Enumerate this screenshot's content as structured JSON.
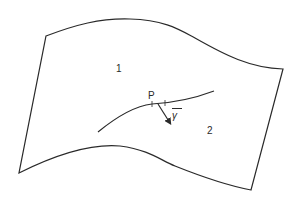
{
  "figure": {
    "surface": {
      "description": "curved surface patch",
      "stroke_color": "#2a2a2a"
    },
    "labels": {
      "region_1": "1",
      "region_2": "2",
      "point": "P",
      "vector": "γ"
    },
    "curve": {
      "description": "curve on surface passing through point P"
    },
    "vector": {
      "description": "vector γ at P pointing into region 2"
    }
  }
}
